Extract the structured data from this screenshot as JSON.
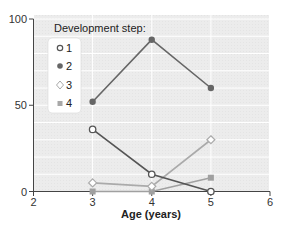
{
  "chart_data": {
    "type": "line",
    "title": "",
    "xlabel": "Age (years)",
    "ylabel": "",
    "xlim": [
      2,
      6
    ],
    "ylim": [
      0,
      100
    ],
    "x_ticks": [
      2,
      3,
      4,
      5,
      6
    ],
    "y_ticks": [
      0,
      50,
      100
    ],
    "grid": true,
    "legend": {
      "title": "Development step:",
      "position": "upper-left",
      "entries": [
        "1",
        "2",
        "3",
        "4"
      ]
    },
    "x": [
      3,
      4,
      5
    ],
    "series": [
      {
        "name": "1",
        "marker": "open-circle",
        "color": "#555555",
        "values": [
          36,
          10,
          0
        ]
      },
      {
        "name": "2",
        "marker": "filled-circle",
        "color": "#666666",
        "values": [
          52,
          88,
          60
        ]
      },
      {
        "name": "3",
        "marker": "open-diamond",
        "color": "#aaaaaa",
        "values": [
          5,
          3,
          30
        ]
      },
      {
        "name": "4",
        "marker": "filled-square",
        "color": "#a0a0a0",
        "values": [
          0,
          0,
          8
        ]
      }
    ]
  },
  "axis": {
    "xlabel": "Age (years)",
    "x_ticks": [
      "2",
      "3",
      "4",
      "5",
      "6"
    ],
    "y_ticks": [
      "0",
      "50",
      "100"
    ]
  },
  "legend": {
    "title": "Development step:",
    "items": [
      "1",
      "2",
      "3",
      "4"
    ]
  }
}
